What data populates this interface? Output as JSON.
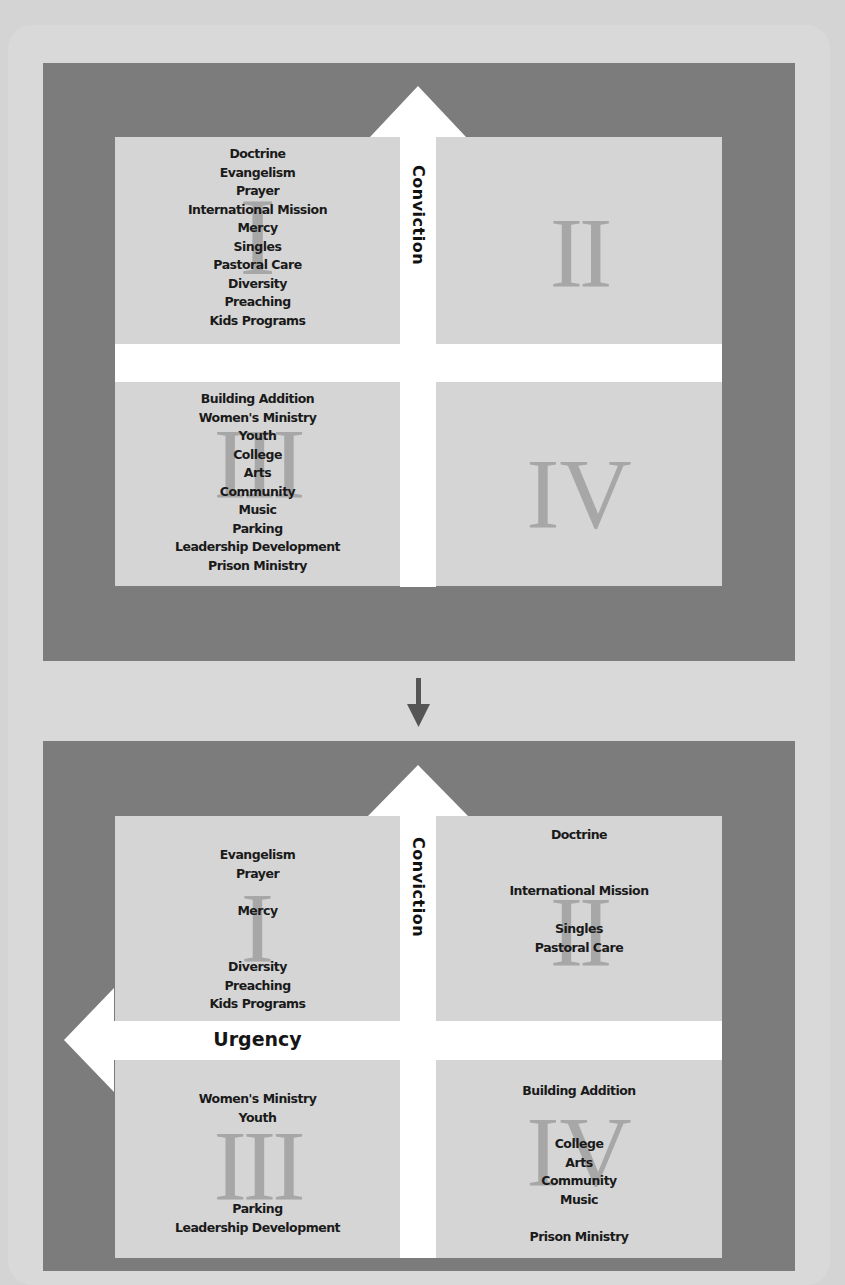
{
  "colors": {
    "page_background": "#d4d4d4",
    "outer_box": "#d9d9d9",
    "frame": "#7c7c7c",
    "panel": "#d5d5d5",
    "arrow": "#ffffff",
    "numeral": "#a7a7a7",
    "text": "#1a1a1a",
    "transition_arrow": "#555555"
  },
  "diagram_before": {
    "vertical_axis_label": "Conviction",
    "quadrants": [
      {
        "numeral": "I",
        "items": [
          "Doctrine",
          "Evangelism",
          "Prayer",
          "International Mission",
          "Mercy",
          "Singles",
          "Pastoral Care",
          "Diversity",
          "Preaching",
          "Kids Programs"
        ]
      },
      {
        "numeral": "II",
        "items": []
      },
      {
        "numeral": "III",
        "items": [
          "Building Addition",
          "Women's Ministry",
          "Youth",
          "College",
          "Arts",
          "Community",
          "Music",
          "Parking",
          "Leadership Development",
          "Prison Ministry"
        ]
      },
      {
        "numeral": "IV",
        "items": []
      }
    ]
  },
  "transition_arrow": "down-arrow-icon",
  "diagram_after": {
    "vertical_axis_label": "Conviction",
    "horizontal_axis_label": "Urgency",
    "quadrants": [
      {
        "numeral": "I",
        "groups": [
          [
            "Evangelism",
            "Prayer"
          ],
          [
            "Mercy"
          ],
          [
            "Diversity",
            "Preaching",
            "Kids Programs"
          ]
        ]
      },
      {
        "numeral": "II",
        "groups": [
          [
            "Doctrine"
          ],
          [
            "International Mission"
          ],
          [
            "Singles",
            "Pastoral Care"
          ]
        ]
      },
      {
        "numeral": "III",
        "groups": [
          [
            "Women's Ministry",
            "Youth"
          ],
          [
            "Parking",
            "Leadership Development"
          ]
        ]
      },
      {
        "numeral": "IV",
        "groups": [
          [
            "Building Addition"
          ],
          [
            "College",
            "Arts",
            "Community",
            "Music"
          ],
          [
            "Prison Ministry"
          ]
        ]
      }
    ]
  }
}
